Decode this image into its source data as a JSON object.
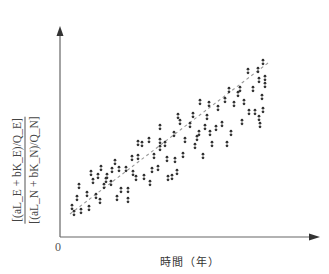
{
  "chart_data": {
    "type": "scatter",
    "title": "",
    "xlabel": "時間（年）",
    "ylabel_numerator": "[(aL_E + bK_E)/Q_E]",
    "ylabel_denominator": "[(aL_N + bK_N)/Q_N]",
    "ylabel": "[(aL_E + bK_E)/Q_E] / [(aL_N + bK_N)/Q_N]",
    "origin_label": "0",
    "grid": false,
    "legend": null,
    "axis_ticks": "none (only origin 0 labeled)",
    "x_range_px": [
      60,
      318
    ],
    "y_range_px": [
      237,
      28
    ],
    "trend_line": {
      "style": "dashed",
      "color": "#999999",
      "from_px": [
        70,
        214
      ],
      "to_px": [
        268,
        63
      ]
    },
    "points_px": [
      [
        72,
        207
      ],
      [
        74,
        213
      ],
      [
        77,
        198
      ],
      [
        81,
        211
      ],
      [
        79,
        186
      ],
      [
        87,
        194
      ],
      [
        89,
        208
      ],
      [
        91,
        173
      ],
      [
        93,
        181
      ],
      [
        96,
        196
      ],
      [
        98,
        176
      ],
      [
        100,
        201
      ],
      [
        101,
        168
      ],
      [
        104,
        186
      ],
      [
        106,
        180
      ],
      [
        107,
        176
      ],
      [
        111,
        183
      ],
      [
        112,
        170
      ],
      [
        115,
        162
      ],
      [
        117,
        198
      ],
      [
        119,
        169
      ],
      [
        121,
        190
      ],
      [
        126,
        169
      ],
      [
        128,
        190
      ],
      [
        128,
        200
      ],
      [
        132,
        158
      ],
      [
        133,
        173
      ],
      [
        136,
        178
      ],
      [
        138,
        143
      ],
      [
        138,
        157
      ],
      [
        142,
        144
      ],
      [
        144,
        177
      ],
      [
        149,
        140
      ],
      [
        150,
        183
      ],
      [
        152,
        170
      ],
      [
        154,
        156
      ],
      [
        158,
        168
      ],
      [
        160,
        148
      ],
      [
        160,
        127
      ],
      [
        160,
        141
      ],
      [
        165,
        144
      ],
      [
        167,
        159
      ],
      [
        168,
        178
      ],
      [
        172,
        177
      ],
      [
        174,
        134
      ],
      [
        175,
        160
      ],
      [
        177,
        172
      ],
      [
        180,
        122
      ],
      [
        178,
        116
      ],
      [
        183,
        155
      ],
      [
        185,
        140
      ],
      [
        190,
        125
      ],
      [
        193,
        115
      ],
      [
        195,
        146
      ],
      [
        197,
        138
      ],
      [
        199,
        133
      ],
      [
        200,
        102
      ],
      [
        203,
        156
      ],
      [
        205,
        127
      ],
      [
        207,
        117
      ],
      [
        209,
        104
      ],
      [
        210,
        133
      ],
      [
        212,
        144
      ],
      [
        216,
        128
      ],
      [
        218,
        108
      ],
      [
        222,
        124
      ],
      [
        225,
        100
      ],
      [
        227,
        144
      ],
      [
        229,
        90
      ],
      [
        231,
        133
      ],
      [
        234,
        104
      ],
      [
        238,
        94
      ],
      [
        240,
        89
      ],
      [
        242,
        122
      ],
      [
        244,
        102
      ],
      [
        248,
        71
      ],
      [
        249,
        112
      ],
      [
        253,
        89
      ],
      [
        255,
        112
      ],
      [
        258,
        70
      ],
      [
        259,
        80
      ],
      [
        262,
        97
      ],
      [
        263,
        62
      ],
      [
        265,
        78
      ],
      [
        265,
        85
      ],
      [
        259,
        118
      ],
      [
        260,
        125
      ],
      [
        263,
        110
      ]
    ]
  },
  "colors": {
    "axis": "#666666",
    "points": "#333333",
    "trend": "#999999",
    "background": "#ffffff"
  }
}
